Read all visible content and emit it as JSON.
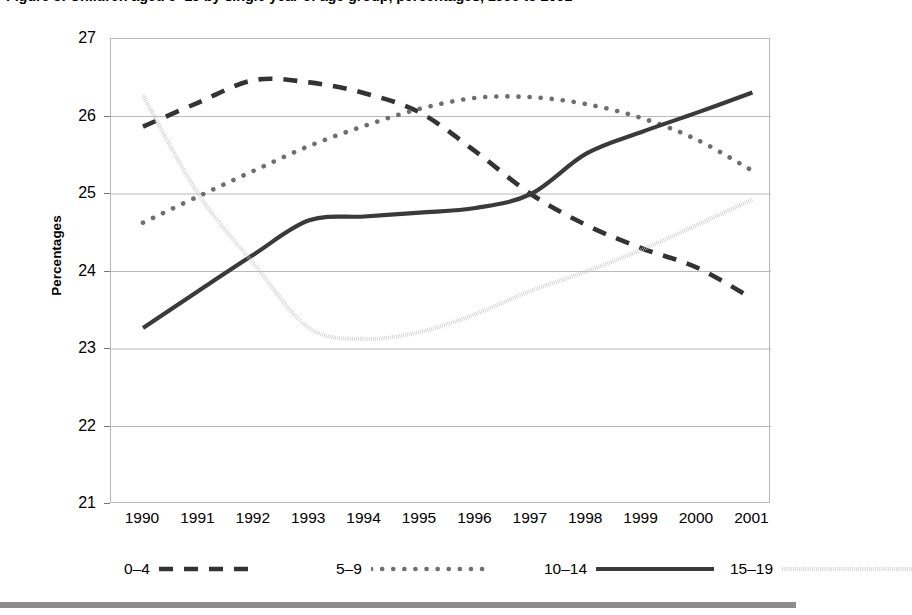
{
  "figure": {
    "title": "Figure 3: Children aged 0–19 by single year of age group, percentages, 1990 to 2001",
    "background_color": "#ffffff",
    "frame_color": "#b9b9b9",
    "gridline_color": "#b9b9b9",
    "bottom_rule_color": "#8c8c8c"
  },
  "chart_data": {
    "type": "line",
    "title": "Figure 3: Children aged 0–19 by single year of age group, percentages, 1990 to 2001",
    "xlabel": "",
    "ylabel": "Percentages",
    "x": [
      1990,
      1991,
      1992,
      1993,
      1994,
      1995,
      1996,
      1997,
      1998,
      1999,
      2000,
      2001
    ],
    "categories": [
      "1990",
      "1991",
      "1992",
      "1993",
      "1994",
      "1995",
      "1996",
      "1997",
      "1998",
      "1999",
      "2000",
      "2001"
    ],
    "xlim": [
      1990,
      2001
    ],
    "ylim": [
      21,
      27
    ],
    "yticks": [
      21,
      22,
      23,
      24,
      25,
      26,
      27
    ],
    "grid": "horizontal",
    "legend_position": "bottom",
    "series": [
      {
        "name": "0–4",
        "style": "dashed",
        "color": "#333333",
        "values": [
          25.87,
          26.18,
          26.47,
          26.44,
          26.3,
          26.05,
          25.55,
          25.0,
          24.6,
          24.3,
          24.05,
          23.65
        ]
      },
      {
        "name": "5–9",
        "style": "dotted",
        "color": "#6e6e6e",
        "values": [
          24.63,
          24.97,
          25.3,
          25.62,
          25.88,
          26.1,
          26.24,
          26.25,
          26.16,
          25.98,
          25.7,
          25.3
        ]
      },
      {
        "name": "10–14",
        "style": "solid",
        "color": "#3a3a3a",
        "values": [
          23.27,
          23.75,
          24.22,
          24.66,
          24.71,
          24.76,
          24.82,
          25.0,
          25.52,
          25.8,
          26.05,
          26.31
        ]
      },
      {
        "name": "15–19",
        "style": "fine-dotted",
        "color": "#c2c2c2",
        "values": [
          26.27,
          25.0,
          24.1,
          23.27,
          23.13,
          23.22,
          23.45,
          23.75,
          24.0,
          24.28,
          24.6,
          24.93
        ]
      }
    ]
  },
  "y_axis": {
    "title": "Percentages",
    "ticks": [
      "27",
      "26",
      "25",
      "24",
      "23",
      "22",
      "21"
    ]
  },
  "x_axis": {
    "ticks": [
      "1990",
      "1991",
      "1992",
      "1993",
      "1994",
      "1995",
      "1996",
      "1997",
      "1998",
      "1999",
      "2000",
      "2001"
    ]
  },
  "legend": {
    "items": [
      {
        "label": "0–4",
        "style": "dashed"
      },
      {
        "label": "5–9",
        "style": "dotted"
      },
      {
        "label": "10–14",
        "style": "solid"
      },
      {
        "label": "15–19",
        "style": "fine-dotted"
      }
    ]
  }
}
